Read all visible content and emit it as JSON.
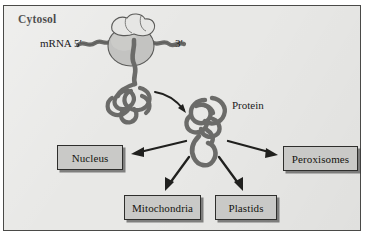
{
  "figure": {
    "domain_kind": "cell-biology-diagram",
    "panel": {
      "title": "Cytosol",
      "background_color": "#e8e8e6",
      "border_color": "#4a4a48"
    },
    "labels": {
      "mrna": "mRNA 5′",
      "three_prime": "3′",
      "protein": "Protein"
    },
    "destination_boxes": [
      {
        "label": "Nucleus"
      },
      {
        "label": "Peroxisomes"
      },
      {
        "label": "Mitochondria"
      },
      {
        "label": "Plastids"
      }
    ],
    "colors": {
      "box_fill": "#c9c9c7",
      "box_border": "#2e2e2c",
      "polypeptide": "#6b6b69",
      "ribosome_large_subunit": "#c3c3c1",
      "ribosome_small_subunit": "#e4e4e2",
      "arrow": "#20201e"
    }
  }
}
